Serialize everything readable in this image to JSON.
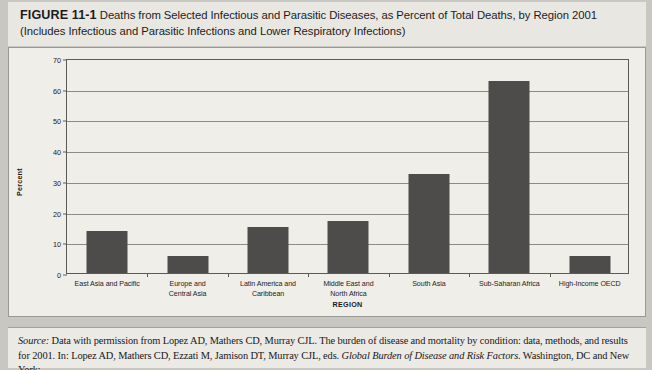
{
  "figure": {
    "label": "FIGURE 11-1",
    "title_line1": "Deaths from Selected Infectious and Parasitic Diseases, as Percent of Total Deaths, by Region 2001",
    "title_line2": "(Includes Infectious and Parasitic Infections and Lower Respiratory Infections)"
  },
  "source": {
    "prefix": "Source:",
    "text_part1": " Data with permission from Lopez AD,  Mathers CD, Murray CJL. The burden of disease and mortality by condition: data, methods, and results for 2001. In: Lopez AD, Mathers CD, Ezzati M, Jamison DT, Murray CJL, eds. ",
    "italic_title": "Global Burden of Disease and Risk Factors",
    "text_part2": ". Washington, DC and New York:"
  },
  "colors": {
    "bar": "#4d4c4a",
    "grid": "#8d8b87",
    "axis": "#5c5a57",
    "panel_bg": "#efeee9",
    "page_bg": "#c9c7c2"
  },
  "chart_data": {
    "type": "bar",
    "title": "Deaths from Selected Infectious and Parasitic Diseases, as Percent of Total Deaths, by Region 2001",
    "xlabel": "REGION",
    "ylabel": "Percent",
    "ylim": [
      0,
      70
    ],
    "yticks": [
      0,
      10,
      20,
      30,
      40,
      50,
      60,
      70
    ],
    "grid": true,
    "legend": false,
    "categories": [
      "East Asia and Pacific",
      "Europe and Central Asia",
      "Latin America and Caribbean",
      "Middle East and North Africa",
      "South Asia",
      "Sub-Saharan Africa",
      "High-Income OECD"
    ],
    "category_lines": [
      [
        "East Asia and Pacific"
      ],
      [
        "Europe and",
        "Central Asia"
      ],
      [
        "Latin America and",
        "Caribbean"
      ],
      [
        "Middle East and",
        "North Africa"
      ],
      [
        "South Asia"
      ],
      [
        "Sub-Saharan Africa"
      ],
      [
        "High-Income OECD"
      ]
    ],
    "values": [
      13.7,
      5.6,
      14.9,
      16.8,
      32.4,
      62.5,
      5.5
    ],
    "units": "percent"
  }
}
